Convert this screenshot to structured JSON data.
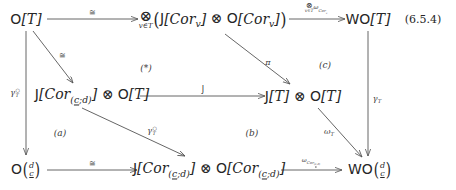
{
  "diagram": {
    "equation_number": "(6.5.4)",
    "nodes": {
      "top_left": {
        "name": "O[T]",
        "text": "O[T]"
      },
      "top_middle": {
        "name": "tensor-v-in-T (J[Cor_v] (x) O[Cor_v])",
        "tensor_sub": "v∈T",
        "inner": "J[Cor_v] ⊗ O[Cor_v]"
      },
      "top_right": {
        "name": "WO[T]",
        "text": "WO[T]"
      },
      "mid_left": {
        "name": "J[Cor_(c;d)] (x) O[T]",
        "text": "J[Cor_(c;d)] ⊗ O[T]"
      },
      "mid_right": {
        "name": "J[T] (x) O[T]",
        "text": "J[T] ⊗ O[T]"
      },
      "bottom_left": {
        "name": "O(d over c)",
        "upper": "d",
        "lower": "c"
      },
      "bottom_middle": {
        "name": "J[Cor_(c;d)] (x) O[Cor_(c;d)]",
        "text": "J[Cor_(c;d)] ⊗ O[Cor_(c;d)]"
      },
      "bottom_right": {
        "name": "WO(d over c)",
        "upper": "d",
        "lower": "c"
      }
    },
    "arrow_labels": {
      "top_horizontal": "≅",
      "top_right_horizontal": {
        "sym": "⊗",
        "sub": "v∈T",
        "rest": "ω",
        "rest_sub": "Cor_v"
      },
      "diag_top_left": "≅",
      "mid_horizontal": "J",
      "diag_top_right": "π",
      "right_vertical": {
        "base": "γ",
        "sub": "T"
      },
      "left_vertical": {
        "base": "γ",
        "sub": "T",
        "sup": "O"
      },
      "diag_mid_left": {
        "base": "γ",
        "sub": "T",
        "sup": "O"
      },
      "diag_mid_right": {
        "base": "ω",
        "sub": "T"
      },
      "bottom_horizontal": "≅",
      "bottom_right_horizontal": {
        "base": "ω",
        "sub": "Cor_(c;d)"
      }
    },
    "region_labels": {
      "star": "(*)",
      "a": "(a)",
      "b": "(b)",
      "c": "(c)"
    }
  }
}
